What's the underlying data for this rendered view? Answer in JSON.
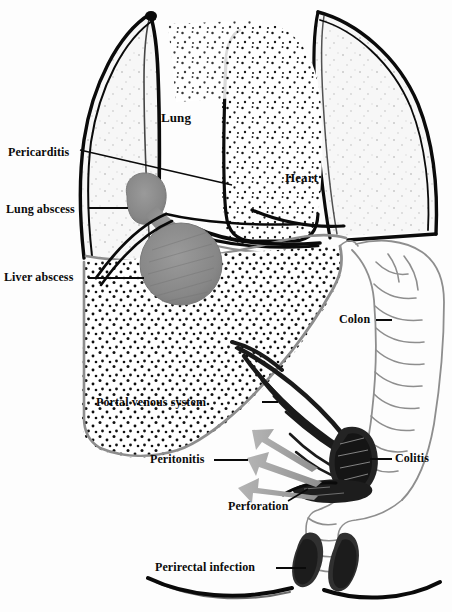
{
  "figure": {
    "width": 452,
    "height": 612,
    "background_color": "#ffffff"
  },
  "palette": {
    "outline_black": "#0a0a0a",
    "abscess_gray": "#8a8a8a",
    "abscess_gray_dark": "#6f6f6f",
    "arrow_gray": "#9a9a9a",
    "diaphragm_gray": "#8d8d8d",
    "colon_outline_gray": "#8e8e8e",
    "lung_fill": "#f6f6f6",
    "stipple_black": "#111111",
    "lesion_black": "#2a2a2a",
    "label_color": "#0b0b0b"
  },
  "labels": [
    {
      "id": "pericarditis",
      "text": "Pericarditis",
      "x": 8,
      "y": 146,
      "size": "sz-12",
      "leader": {
        "x1": 80,
        "y1": 150,
        "x2": 232,
        "y2": 185,
        "angled": true
      }
    },
    {
      "id": "lung_abscess",
      "text": "Lung abscess",
      "x": 6,
      "y": 203,
      "size": "sz-12",
      "leader": {
        "x1": 88,
        "y1": 207,
        "x2": 127,
        "y2": 207,
        "angled": false
      }
    },
    {
      "id": "liver_abscess",
      "text": "Liver abscess",
      "x": 4,
      "y": 271,
      "size": "sz-12",
      "leader": {
        "x1": 88,
        "y1": 276,
        "x2": 143,
        "y2": 276,
        "angled": false
      }
    },
    {
      "id": "lung",
      "text": "Lung",
      "x": 161,
      "y": 111,
      "size": "sz-13",
      "leader": null
    },
    {
      "id": "heart",
      "text": "Heart",
      "x": 285,
      "y": 171,
      "size": "sz-13",
      "leader": null
    },
    {
      "id": "colon",
      "text": "Colon",
      "x": 339,
      "y": 313,
      "size": "sz-12",
      "leader": {
        "x1": 375,
        "y1": 318,
        "x2": 391,
        "y2": 318,
        "angled": false
      }
    },
    {
      "id": "portal_venous",
      "text": "Portal venous system",
      "x": 96,
      "y": 396,
      "size": "sz-12",
      "leader": {
        "x1": 262,
        "y1": 400,
        "x2": 278,
        "y2": 400,
        "angled": false
      }
    },
    {
      "id": "peritonitis",
      "text": "Peritonitis",
      "x": 150,
      "y": 453,
      "size": "sz-12",
      "leader": {
        "x1": 214,
        "y1": 458,
        "x2": 248,
        "y2": 458,
        "angled": false
      }
    },
    {
      "id": "colitis",
      "text": "Colitis",
      "x": 395,
      "y": 452,
      "size": "sz-12",
      "leader": {
        "x1": 370,
        "y1": 457,
        "x2": 392,
        "y2": 457,
        "angled": false
      }
    },
    {
      "id": "perforation",
      "text": "Perforation",
      "x": 228,
      "y": 500,
      "size": "sz-12",
      "leader": {
        "x1": 288,
        "y1": 500,
        "x2": 306,
        "y2": 489,
        "angled": true
      }
    },
    {
      "id": "perirectal",
      "text": "Perirectal infection",
      "x": 155,
      "y": 561,
      "size": "sz-12",
      "leader": {
        "x1": 275,
        "y1": 566,
        "x2": 305,
        "y2": 566,
        "angled": false
      }
    }
  ],
  "structures": [
    {
      "id": "left-lung",
      "name": "Lung",
      "kind": "organ",
      "fill": "stippled-light"
    },
    {
      "id": "right-lung",
      "name": "Lung",
      "kind": "organ",
      "fill": "stippled-light"
    },
    {
      "id": "heart",
      "name": "Heart",
      "kind": "organ",
      "fill": "stippled-dense"
    },
    {
      "id": "liver",
      "name": "Liver",
      "kind": "organ",
      "fill": "stippled-dense"
    },
    {
      "id": "colon",
      "name": "Colon",
      "kind": "organ",
      "fill": "outline-haustra"
    },
    {
      "id": "lung-abscess",
      "name": "Lung abscess",
      "kind": "lesion",
      "fill": "gray"
    },
    {
      "id": "liver-abscess",
      "name": "Liver abscess",
      "kind": "lesion",
      "fill": "gray"
    },
    {
      "id": "colitis-lesion",
      "name": "Colitis",
      "kind": "lesion",
      "fill": "black"
    },
    {
      "id": "perforation-lesion",
      "name": "Perforation",
      "kind": "lesion",
      "fill": "black"
    },
    {
      "id": "perirectal-left",
      "name": "Perirectal infection",
      "kind": "lesion",
      "fill": "black"
    },
    {
      "id": "perirectal-right",
      "name": "Perirectal infection",
      "kind": "lesion",
      "fill": "black"
    },
    {
      "id": "portal-veins",
      "name": "Portal venous system",
      "kind": "vessels",
      "fill": "black"
    },
    {
      "id": "peritonitis-arrows",
      "name": "Peritonitis spread arrows",
      "kind": "arrows",
      "fill": "gray"
    }
  ],
  "arrows": {
    "count": 3,
    "color": "#9a9a9a",
    "direction": "outward to the left from the perforation site"
  }
}
